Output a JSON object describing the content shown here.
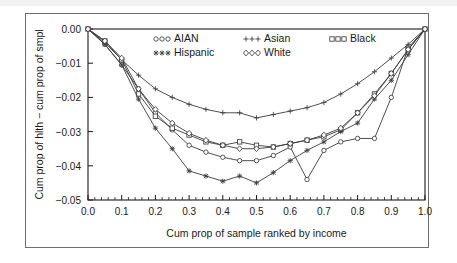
{
  "chart_data": {
    "type": "line",
    "title": "",
    "xlabel": "Cum prop of sample ranked by income",
    "ylabel": "Cum prop of hlth − cum prop of smpl",
    "xlim": [
      0.0,
      1.0
    ],
    "ylim": [
      -0.05,
      0.0
    ],
    "xticks": [
      "0.0",
      "0.1",
      "0.2",
      "0.3",
      "0.4",
      "0.5",
      "0.6",
      "0.7",
      "0.8",
      "0.9",
      "1.0"
    ],
    "xtick_values": [
      0.0,
      0.1,
      0.2,
      0.3,
      0.4,
      0.5,
      0.6,
      0.7,
      0.8,
      0.9,
      1.0
    ],
    "yticks": [
      "0.00",
      "-0.01",
      "-0.02",
      "-0.03",
      "-0.04",
      "-0.05"
    ],
    "ytick_values": [
      0.0,
      -0.01,
      -0.02,
      -0.03,
      -0.04,
      -0.05
    ],
    "grid": false,
    "legend_position": "top-inside",
    "x": [
      0.0,
      0.05,
      0.1,
      0.15,
      0.2,
      0.25,
      0.3,
      0.35,
      0.4,
      0.45,
      0.5,
      0.55,
      0.6,
      0.65,
      0.7,
      0.75,
      0.8,
      0.85,
      0.9,
      0.95,
      1.0
    ],
    "series": [
      {
        "name": "AIAN",
        "marker": "circle",
        "values": [
          0.0,
          -0.0045,
          -0.0105,
          -0.0175,
          -0.0245,
          -0.0295,
          -0.034,
          -0.036,
          -0.0375,
          -0.0385,
          -0.0385,
          -0.037,
          -0.0345,
          -0.044,
          -0.0355,
          -0.033,
          -0.032,
          -0.032,
          -0.02,
          -0.0055,
          0.0
        ]
      },
      {
        "name": "Asian",
        "marker": "plus",
        "values": [
          0.0,
          -0.004,
          -0.009,
          -0.0135,
          -0.0175,
          -0.02,
          -0.022,
          -0.0235,
          -0.0245,
          -0.0245,
          -0.026,
          -0.025,
          -0.024,
          -0.023,
          -0.0215,
          -0.019,
          -0.016,
          -0.0125,
          -0.0085,
          -0.0045,
          0.0
        ]
      },
      {
        "name": "Black",
        "marker": "square",
        "values": [
          0.0,
          -0.0035,
          -0.009,
          -0.019,
          -0.0255,
          -0.029,
          -0.031,
          -0.033,
          -0.034,
          -0.033,
          -0.034,
          -0.0345,
          -0.0335,
          -0.0325,
          -0.0315,
          -0.0295,
          -0.0245,
          -0.019,
          -0.013,
          -0.006,
          0.0
        ]
      },
      {
        "name": "Hispanic",
        "marker": "star",
        "values": [
          0.0,
          -0.0045,
          -0.0105,
          -0.0205,
          -0.029,
          -0.035,
          -0.0415,
          -0.043,
          -0.0445,
          -0.043,
          -0.045,
          -0.042,
          -0.0385,
          -0.0355,
          -0.033,
          -0.03,
          -0.0275,
          -0.0205,
          -0.015,
          -0.0075,
          0.0
        ]
      },
      {
        "name": "White",
        "marker": "diamond",
        "values": [
          0.0,
          -0.0035,
          -0.0085,
          -0.0175,
          -0.0235,
          -0.0275,
          -0.0305,
          -0.0325,
          -0.034,
          -0.035,
          -0.035,
          -0.0345,
          -0.0335,
          -0.0325,
          -0.031,
          -0.029,
          -0.0245,
          -0.0195,
          -0.013,
          -0.006,
          0.0
        ]
      }
    ]
  },
  "legend": {
    "entries": [
      {
        "label": "AIAN",
        "marker": "circle"
      },
      {
        "label": "Asian",
        "marker": "plus"
      },
      {
        "label": "Black",
        "marker": "square"
      },
      {
        "label": "Hispanic",
        "marker": "star"
      },
      {
        "label": "White",
        "marker": "diamond"
      }
    ]
  },
  "colors": {
    "line": "#3c3c3c",
    "axis": "#1a1a1a",
    "text": "#1a1a1a",
    "frame": "#6e6e6e",
    "background": "#ffffff"
  }
}
